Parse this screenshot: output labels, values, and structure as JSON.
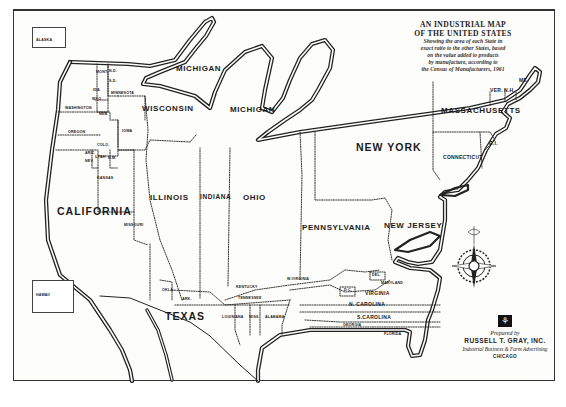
{
  "title": {
    "line1": "AN INDUSTRIAL MAP",
    "line2": "OF THE UNITED STATES",
    "subtitle": [
      "Showing the area of each State in",
      "exact ratio to the other States, based",
      "on the value added to products",
      "by manufacture, according to",
      "the Census of Manufacturers, 1961"
    ]
  },
  "credit": {
    "logo_icon": "rg-logo",
    "prepared_by": "Prepared by",
    "company": "RUSSELL T. GRAY, INC.",
    "tagline": "Industrial Business & Farm Advertising",
    "city": "CHICAGO"
  },
  "insets": {
    "alaska": "ALASKA",
    "hawaii": "HAWAII"
  },
  "states": {
    "michigan_upper": "MICHIGAN",
    "wisconsin": "WISCONSIN",
    "michigan": "MICHIGAN",
    "massachusetts": "MASSACHUSETTS",
    "new_york": "NEW YORK",
    "connecticut": "CONNECTICUT",
    "rhode_island": "R.I.",
    "vermont": "VER.",
    "new_hampshire": "N.H.",
    "maine": "ME.",
    "california": "CALIFORNIA",
    "illinois": "ILLINOIS",
    "indiana": "INDIANA",
    "ohio": "OHIO",
    "pennsylvania": "PENNSYLVANIA",
    "new_jersey": "NEW JERSEY",
    "texas": "TEXAS",
    "missouri": "MISSOURI",
    "iowa": "IOWA",
    "kansas": "KANSAS",
    "oregon": "OREGON",
    "washington": "WASHINGTON",
    "minnesota": "MINNESOTA",
    "colorado": "COLO.",
    "utah": "UTAH",
    "new_mexico": "N.M.",
    "arizona": "ARIZ.",
    "nevada": "NEV.",
    "nebraska": "NEB.",
    "idaho": "IDA.",
    "montana": "MONT.",
    "wyoming": "WYO.",
    "north_dakota": "N.D.",
    "south_dakota": "S.D.",
    "oklahoma": "OKLA.",
    "arkansas": "ARK.",
    "kentucky": "KENTUCKY",
    "tennessee": "TENNESSEE",
    "west_virginia": "W.VIRGINIA",
    "louisiana": "LOUISIANA",
    "mississippi": "MISS.",
    "alabama": "ALABAMA",
    "delaware": "DEL.",
    "maryland": "MARYLAND",
    "dc": "D.C.",
    "virginia": "VIRGINIA",
    "north_carolina": "N. CAROLINA",
    "south_carolina": "S.CAROLINA",
    "georgia": "GEORGIA",
    "florida": "FLORIDA"
  },
  "compass": "compass-rose-icon"
}
